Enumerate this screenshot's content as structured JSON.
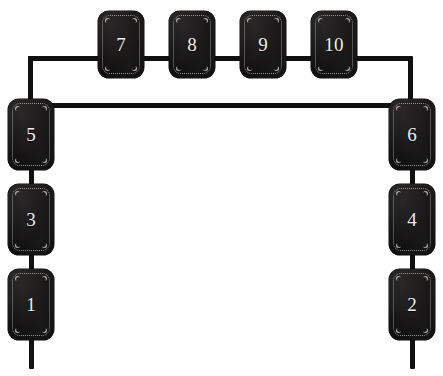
{
  "canvas": {
    "width": 443,
    "height": 376,
    "background_color": "#fefefe",
    "plate_color": "#1a1818",
    "stitch_color": "#e1dcd6",
    "number_color": "#f2efec",
    "connector_color": "#111010"
  },
  "diagram": {
    "plate_count": 10
  },
  "plates": [
    {
      "id": "plate-7",
      "label": "7",
      "group": "top-row",
      "x": 98,
      "y": 11,
      "w": 46,
      "h": 67
    },
    {
      "id": "plate-8",
      "label": "8",
      "group": "top-row",
      "x": 169,
      "y": 11,
      "w": 46,
      "h": 67
    },
    {
      "id": "plate-9",
      "label": "9",
      "group": "top-row",
      "x": 240,
      "y": 11,
      "w": 46,
      "h": 67
    },
    {
      "id": "plate-10",
      "label": "10",
      "group": "top-row",
      "x": 311,
      "y": 11,
      "w": 46,
      "h": 67
    },
    {
      "id": "plate-5",
      "label": "5",
      "group": "left-column",
      "x": 8,
      "y": 99,
      "w": 46,
      "h": 71
    },
    {
      "id": "plate-3",
      "label": "3",
      "group": "left-column",
      "x": 8,
      "y": 184,
      "w": 46,
      "h": 71
    },
    {
      "id": "plate-1",
      "label": "1",
      "group": "left-column",
      "x": 8,
      "y": 269,
      "w": 46,
      "h": 71
    },
    {
      "id": "plate-6",
      "label": "6",
      "group": "right-column",
      "x": 389,
      "y": 99,
      "w": 46,
      "h": 71
    },
    {
      "id": "plate-4",
      "label": "4",
      "group": "right-column",
      "x": 389,
      "y": 184,
      "w": 46,
      "h": 71
    },
    {
      "id": "plate-2",
      "label": "2",
      "group": "right-column",
      "x": 389,
      "y": 269,
      "w": 46,
      "h": 71
    }
  ],
  "connectors": [
    {
      "id": "top-rail",
      "orient": "h",
      "x": 28,
      "y": 56,
      "len": 384
    },
    {
      "id": "left-drop",
      "orient": "v",
      "x": 28,
      "y": 56,
      "len": 50
    },
    {
      "id": "right-drop",
      "orient": "v",
      "x": 408,
      "y": 56,
      "len": 50
    },
    {
      "id": "mid-rail",
      "orient": "h",
      "x": 50,
      "y": 103,
      "len": 344
    },
    {
      "id": "link-5-3",
      "orient": "v",
      "x": 29,
      "y": 166,
      "len": 22
    },
    {
      "id": "link-3-1",
      "orient": "v",
      "x": 29,
      "y": 251,
      "len": 22
    },
    {
      "id": "tail-1",
      "orient": "v",
      "x": 29,
      "y": 336,
      "len": 33
    },
    {
      "id": "link-6-4",
      "orient": "v",
      "x": 410,
      "y": 166,
      "len": 22
    },
    {
      "id": "link-4-2",
      "orient": "v",
      "x": 410,
      "y": 251,
      "len": 22
    },
    {
      "id": "tail-2",
      "orient": "v",
      "x": 410,
      "y": 336,
      "len": 33
    }
  ]
}
